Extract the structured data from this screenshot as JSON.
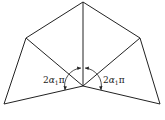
{
  "diagram": {
    "labels": {
      "left_angle": {
        "coef": "2",
        "symbol": "α",
        "subscript": "1",
        "suffix": "π"
      },
      "right_angle": {
        "coef": "2",
        "symbol": "α",
        "subscript": "1",
        "suffix": "π"
      }
    },
    "stroke_color": "#222222",
    "background": "#ffffff"
  }
}
